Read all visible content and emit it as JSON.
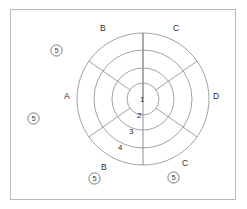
{
  "figure": {
    "frame": {
      "border_color": "#b9b9b9",
      "background": "#ffffff"
    },
    "center": {
      "x": 143,
      "y": 99
    },
    "ring_stroke_color": "#8a8a8a",
    "rings": [
      {
        "index": 1,
        "radius": 16,
        "label": "1"
      },
      {
        "index": 2,
        "radius": 31,
        "label": "2"
      },
      {
        "index": 3,
        "radius": 49,
        "label": "3"
      },
      {
        "index": 4,
        "radius": 66,
        "label": "4"
      }
    ],
    "ring_labels": [
      {
        "text": "1",
        "x": 140,
        "y": 95
      },
      {
        "text": "2",
        "x": 137,
        "y": 111
      },
      {
        "text": "3",
        "x": 129,
        "y": 127
      },
      {
        "text": "4",
        "x": 118,
        "y": 143
      }
    ],
    "sector_labels": [
      {
        "text": "B",
        "x": 100,
        "y": 24,
        "position": "top-left"
      },
      {
        "text": "C",
        "x": 173,
        "y": 24,
        "position": "top-right"
      },
      {
        "text": "A",
        "x": 64,
        "y": 92,
        "position": "left"
      },
      {
        "text": "D",
        "x": 213,
        "y": 92,
        "position": "right"
      },
      {
        "text": "B",
        "x": 101,
        "y": 163,
        "position": "bottom-left"
      },
      {
        "text": "C",
        "x": 182,
        "y": 159,
        "position": "bottom-right"
      }
    ],
    "callouts": [
      {
        "text": "5",
        "x": 50,
        "y": 44,
        "position": "upper-left"
      },
      {
        "text": "5",
        "x": 27,
        "y": 112,
        "position": "mid-left"
      },
      {
        "text": "5",
        "x": 88,
        "y": 172,
        "position": "lower-left"
      },
      {
        "text": "5",
        "x": 167,
        "y": 171,
        "position": "lower-right"
      }
    ],
    "spokes": [
      {
        "name": "spine-vertical",
        "angle_deg": 90,
        "from_radius": 0,
        "to_radius": 66
      },
      {
        "name": "spoke-upper-left",
        "angle_deg": 145,
        "from_radius": 16,
        "to_radius": 66
      },
      {
        "name": "spoke-upper-right",
        "angle_deg": 35,
        "from_radius": 16,
        "to_radius": 66
      },
      {
        "name": "spoke-lower-left",
        "angle_deg": 215,
        "from_radius": 16,
        "to_radius": 66
      },
      {
        "name": "spoke-lower-right",
        "angle_deg": 325,
        "from_radius": 16,
        "to_radius": 66
      }
    ]
  }
}
